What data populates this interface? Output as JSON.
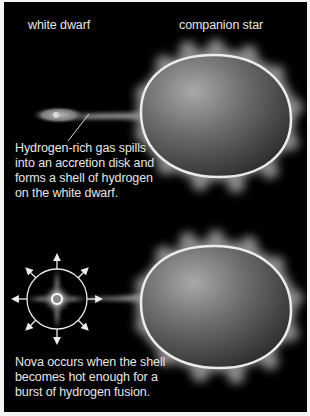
{
  "diagram": {
    "panels": [
      {
        "id": "accretion",
        "labels": {
          "white_dwarf": "white dwarf",
          "companion_star": "companion star"
        },
        "caption": "Hydrogen-rich gas spills\ninto an accretion disk and\nforms a shell of hydrogen\non the white dwarf."
      },
      {
        "id": "nova",
        "caption": "Nova occurs when the shell\nbecomes hot enough for a\nburst of hydrogen fusion."
      }
    ],
    "colors": {
      "background": "#000000",
      "text": "#e6e6e6",
      "star_fill_light": "#9a9a9a",
      "star_fill_dark": "#3a3a3a",
      "star_rim": "#e8e8e8"
    }
  }
}
